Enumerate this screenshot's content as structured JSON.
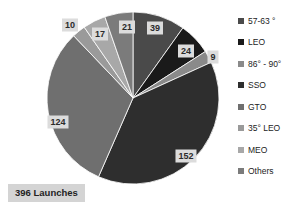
{
  "chart_data": {
    "type": "pie",
    "title": "",
    "total_label": "396 Launches",
    "total": 396,
    "categories": [
      "57-63 °",
      "LEO",
      "86° - 90°",
      "SSO",
      "GTO",
      "35° LEO",
      "MEO",
      "Others"
    ],
    "values": [
      39,
      24,
      9,
      152,
      124,
      10,
      17,
      21
    ],
    "colors": [
      "#4a4a4a",
      "#1a1a1a",
      "#8a8a8a",
      "#2e2e2e",
      "#6f6f6f",
      "#9a9a9a",
      "#a8a8a8",
      "#7b7b7b"
    ],
    "legend_position": "right",
    "grid": false,
    "start_angle_deg": 0,
    "direction": "clockwise"
  },
  "pie": {
    "slices": [
      {
        "label": "39",
        "value": 39,
        "category": "57-63 °",
        "color": "#4a4a4a",
        "label_x": 155,
        "label_y": 28
      },
      {
        "label": "24",
        "value": 24,
        "category": "LEO",
        "color": "#1a1a1a",
        "label_x": 186,
        "label_y": 51
      },
      {
        "label": "9",
        "value": 9,
        "category": "86° - 90°",
        "color": "#8a8a8a",
        "label_x": 213,
        "label_y": 57
      },
      {
        "label": "152",
        "value": 152,
        "category": "SSO",
        "color": "#2e2e2e",
        "label_x": 186,
        "label_y": 156
      },
      {
        "label": "124",
        "value": 124,
        "category": "GTO",
        "color": "#6f6f6f",
        "label_x": 58,
        "label_y": 122
      },
      {
        "label": "10",
        "value": 10,
        "category": "35° LEO",
        "color": "#9a9a9a",
        "label_x": 70,
        "label_y": 25
      },
      {
        "label": "17",
        "value": 17,
        "category": "MEO",
        "color": "#a8a8a8",
        "label_x": 100,
        "label_y": 34
      },
      {
        "label": "21",
        "value": 21,
        "category": "Others",
        "color": "#7b7b7b",
        "label_x": 127,
        "label_y": 27
      }
    ],
    "geometry": {
      "cx": 133,
      "cy": 98,
      "r": 86
    }
  },
  "legend": {
    "items": [
      {
        "label": "57-63 °",
        "color": "#4a4a4a"
      },
      {
        "label": "LEO",
        "color": "#1a1a1a"
      },
      {
        "label": "86° - 90°",
        "color": "#8a8a8a"
      },
      {
        "label": "SSO",
        "color": "#2e2e2e"
      },
      {
        "label": "GTO",
        "color": "#6f6f6f"
      },
      {
        "label": "35° LEO",
        "color": "#9a9a9a"
      },
      {
        "label": "MEO",
        "color": "#a8a8a8"
      },
      {
        "label": "Others",
        "color": "#7b7b7b"
      }
    ]
  }
}
